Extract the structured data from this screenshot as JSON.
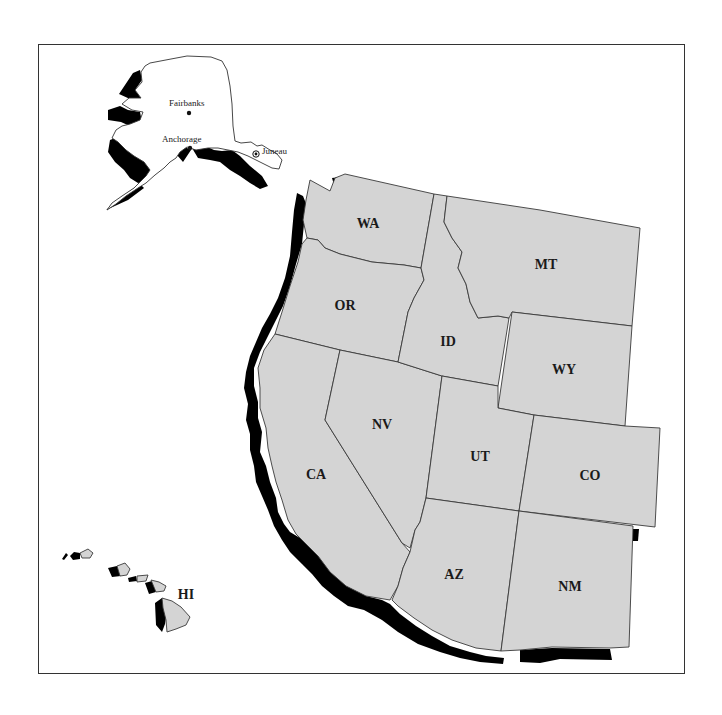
{
  "map": {
    "title": "",
    "region": "Western United States",
    "fill_color": "#d4d4d4",
    "shadow_color": "#000000",
    "frame_color": "#333333",
    "states": [
      {
        "code": "WA",
        "x": 368,
        "y": 228
      },
      {
        "code": "OR",
        "x": 345,
        "y": 310
      },
      {
        "code": "ID",
        "x": 448,
        "y": 346
      },
      {
        "code": "MT",
        "x": 546,
        "y": 268
      },
      {
        "code": "WY",
        "x": 564,
        "y": 373
      },
      {
        "code": "NV",
        "x": 382,
        "y": 428
      },
      {
        "code": "UT",
        "x": 480,
        "y": 460
      },
      {
        "code": "CO",
        "x": 590,
        "y": 478
      },
      {
        "code": "CA",
        "x": 316,
        "y": 477
      },
      {
        "code": "AZ",
        "x": 454,
        "y": 578
      },
      {
        "code": "NM",
        "x": 570,
        "y": 590
      },
      {
        "code": "HI",
        "x": 186,
        "y": 597
      }
    ],
    "cities": [
      {
        "name": "Fairbanks",
        "x": 169,
        "y": 106,
        "marker": "dot"
      },
      {
        "name": "Anchorage",
        "x": 162,
        "y": 142,
        "marker": "dot"
      },
      {
        "name": "Juneau",
        "x": 262,
        "y": 154,
        "marker": "capital-star"
      }
    ]
  }
}
